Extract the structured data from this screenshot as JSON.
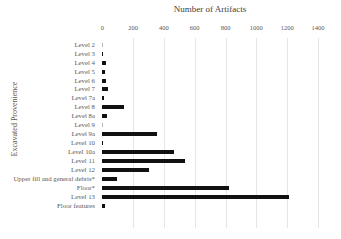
{
  "chart_data": {
    "type": "bar",
    "orientation": "horizontal",
    "title": "Number of Artifacts",
    "xlabel": "Number of Artifacts",
    "ylabel": "Excavated Provenience",
    "xlim": [
      0,
      1400
    ],
    "xticks": [
      0,
      200,
      400,
      600,
      800,
      1000,
      1200,
      1400
    ],
    "grid": true,
    "legend": null,
    "bar_color": "#111111",
    "categories": [
      "Level 2",
      "Level 3",
      "Level 4",
      "Level 5",
      "Level 6",
      "Level 7",
      "Level 7a",
      "Level 8",
      "Level 8a",
      "Level 9",
      "Level 9a",
      "Level 10",
      "Level 10a",
      "Level 11",
      "Level 12",
      "Upper fill and general debris*",
      "Floor*",
      "Level 13",
      "Floor features"
    ],
    "values": [
      2,
      5,
      22,
      20,
      22,
      38,
      8,
      143,
      32,
      2,
      357,
      7,
      468,
      537,
      305,
      94,
      825,
      1210,
      20
    ]
  }
}
